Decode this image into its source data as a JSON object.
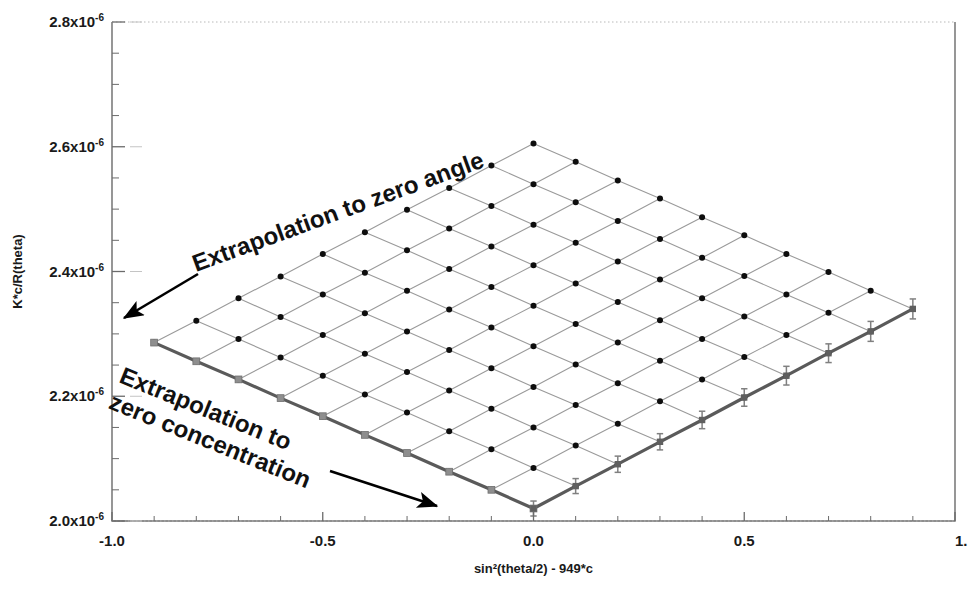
{
  "figure": {
    "name": "zimm-plot",
    "width": 973,
    "height": 591,
    "background": "#ffffff"
  },
  "axes": {
    "frame_color": "#6b6b6b",
    "left_px": 112,
    "right_px": 955,
    "top_px": 22,
    "bottom_px": 521,
    "x": {
      "label": "sin²(theta/2) - 949*c",
      "min": -1.0,
      "max": 1.0,
      "major_ticks": [
        -1.0,
        -0.5,
        0.0,
        0.5,
        1.0
      ],
      "major_tick_labels": [
        "-1.0",
        "-0.5",
        "0.0",
        "0.5",
        "1."
      ],
      "minor_step": 0.1
    },
    "y": {
      "label": "K*c/R(theta)",
      "min": 2e-06,
      "max": 2.8e-06,
      "major_ticks": [
        2e-06,
        2.2e-06,
        2.4e-06,
        2.6e-06,
        2.8e-06
      ],
      "major_tick_labels": [
        {
          "mantissa": "2.0x10",
          "exponent": "-6"
        },
        {
          "mantissa": "2.2x10",
          "exponent": "-6"
        },
        {
          "mantissa": "2.4x10",
          "exponent": "-6"
        },
        {
          "mantissa": "2.6x10",
          "exponent": "-6"
        },
        {
          "mantissa": "2.8x10",
          "exponent": "-6"
        }
      ],
      "minor_step": 5e-08
    }
  },
  "annotations": [
    {
      "name": "extrapolation-zero-angle-label",
      "lines": [
        "Extrapolation to zero angle"
      ],
      "x": 196,
      "y": 272,
      "rotation": -20
    },
    {
      "name": "extrapolation-zero-concentration-label",
      "lines": [
        "Extrapolation to",
        "zero concentration"
      ],
      "x": 118,
      "y": 382,
      "rotation": 22
    }
  ],
  "arrows": [
    {
      "name": "zero-angle-arrow",
      "x1": 198,
      "y1": 274,
      "x2": 124,
      "y2": 318,
      "color": "#000000"
    },
    {
      "name": "zero-concentration-arrow",
      "x1": 330,
      "y1": 471,
      "x2": 437,
      "y2": 506,
      "color": "#000000"
    }
  ],
  "style": {
    "mesh_line_color": "#9a9a9a",
    "mesh_line_width": 1.1,
    "envelope_color": "#5a5a5a",
    "envelope_width": 3.2,
    "marker_color": "#0d0d0d",
    "marker_radius": 3.0,
    "extrap_marker_color": "#8e8e8e",
    "errorbar_color": "#808080"
  },
  "chart_data": {
    "type": "line",
    "title": "",
    "xlabel": "sin²(theta/2) - 949*c",
    "ylabel": "K*c/R(theta)",
    "xlim": [
      -1.0,
      1.0
    ],
    "ylim": [
      2e-06,
      2.8e-06
    ],
    "grid": false,
    "legend": "none",
    "k_stretch": 949,
    "concentrations_count": 10,
    "angles_count": 10,
    "q2_values": [
      0.0,
      0.1,
      0.2,
      0.3,
      0.4,
      0.5,
      0.6,
      0.7,
      0.8,
      0.9
    ],
    "c_offsets": [
      0.0,
      0.1,
      0.2,
      0.3,
      0.4,
      0.5,
      0.6,
      0.7,
      0.8,
      0.9
    ],
    "intercept": 2.02e-06,
    "angle_slope": 3.55e-07,
    "conc_slope": 2.95e-07,
    "series": [
      {
        "name": "c1",
        "c_index": 0,
        "x": [
          0.0,
          0.1,
          0.2,
          0.3,
          0.4,
          0.5,
          0.6,
          0.7,
          0.8,
          0.9
        ],
        "values": [
          2.02e-06,
          2.056e-06,
          2.091e-06,
          2.127e-06,
          2.162e-06,
          2.198e-06,
          2.233e-06,
          2.269e-06,
          2.304e-06,
          2.34e-06
        ]
      },
      {
        "name": "c2",
        "c_index": 1,
        "x": [
          -0.1,
          0.0,
          0.1,
          0.2,
          0.3,
          0.4,
          0.5,
          0.6,
          0.7,
          0.8
        ],
        "values": [
          2.05e-06,
          2.085e-06,
          2.121e-06,
          2.156e-06,
          2.192e-06,
          2.227e-06,
          2.263e-06,
          2.298e-06,
          2.334e-06,
          2.369e-06
        ]
      },
      {
        "name": "c3",
        "c_index": 2,
        "x": [
          -0.2,
          -0.1,
          0.0,
          0.1,
          0.2,
          0.3,
          0.4,
          0.5,
          0.6,
          0.7
        ],
        "values": [
          2.079e-06,
          2.115e-06,
          2.15e-06,
          2.186e-06,
          2.221e-06,
          2.257e-06,
          2.292e-06,
          2.328e-06,
          2.363e-06,
          2.399e-06
        ]
      },
      {
        "name": "c4",
        "c_index": 3,
        "x": [
          -0.3,
          -0.2,
          -0.1,
          0.0,
          0.1,
          0.2,
          0.3,
          0.4,
          0.5,
          0.6
        ],
        "values": [
          2.109e-06,
          2.144e-06,
          2.18e-06,
          2.215e-06,
          2.251e-06,
          2.286e-06,
          2.322e-06,
          2.357e-06,
          2.393e-06,
          2.428e-06
        ]
      },
      {
        "name": "c5",
        "c_index": 4,
        "x": [
          -0.4,
          -0.3,
          -0.2,
          -0.1,
          0.0,
          0.1,
          0.2,
          0.3,
          0.4,
          0.5
        ],
        "values": [
          2.138e-06,
          2.174e-06,
          2.209e-06,
          2.245e-06,
          2.28e-06,
          2.316e-06,
          2.351e-06,
          2.387e-06,
          2.422e-06,
          2.458e-06
        ]
      },
      {
        "name": "c6",
        "c_index": 5,
        "x": [
          -0.5,
          -0.4,
          -0.3,
          -0.2,
          -0.1,
          0.0,
          0.1,
          0.2,
          0.3,
          0.4
        ],
        "values": [
          2.168e-06,
          2.203e-06,
          2.239e-06,
          2.274e-06,
          2.31e-06,
          2.345e-06,
          2.381e-06,
          2.416e-06,
          2.452e-06,
          2.487e-06
        ]
      },
      {
        "name": "c7",
        "c_index": 6,
        "x": [
          -0.6,
          -0.5,
          -0.4,
          -0.3,
          -0.2,
          -0.1,
          0.0,
          0.1,
          0.2,
          0.3
        ],
        "values": [
          2.197e-06,
          2.233e-06,
          2.268e-06,
          2.304e-06,
          2.339e-06,
          2.375e-06,
          2.41e-06,
          2.446e-06,
          2.481e-06,
          2.517e-06
        ]
      },
      {
        "name": "c8",
        "c_index": 7,
        "x": [
          -0.7,
          -0.6,
          -0.5,
          -0.4,
          -0.3,
          -0.2,
          -0.1,
          0.0,
          0.1,
          0.2
        ],
        "values": [
          2.227e-06,
          2.262e-06,
          2.298e-06,
          2.333e-06,
          2.369e-06,
          2.404e-06,
          2.44e-06,
          2.475e-06,
          2.511e-06,
          2.546e-06
        ]
      },
      {
        "name": "c9",
        "c_index": 8,
        "x": [
          -0.8,
          -0.7,
          -0.6,
          -0.5,
          -0.4,
          -0.3,
          -0.2,
          -0.1,
          0.0,
          0.1
        ],
        "values": [
          2.256e-06,
          2.292e-06,
          2.327e-06,
          2.363e-06,
          2.398e-06,
          2.434e-06,
          2.469e-06,
          2.505e-06,
          2.54e-06,
          2.576e-06
        ]
      },
      {
        "name": "c10",
        "c_index": 9,
        "x": [
          -0.9,
          -0.8,
          -0.7,
          -0.6,
          -0.5,
          -0.4,
          -0.3,
          -0.2,
          -0.1,
          0.0
        ],
        "values": [
          2.286e-06,
          2.321e-06,
          2.357e-06,
          2.392e-06,
          2.428e-06,
          2.463e-06,
          2.499e-06,
          2.534e-06,
          2.57e-06,
          2.605e-06
        ]
      }
    ],
    "zero_angle_line": {
      "name": "extrapolation-to-zero-angle",
      "x": [
        0.0,
        -0.1,
        -0.2,
        -0.3,
        -0.4,
        -0.5,
        -0.6,
        -0.7,
        -0.8,
        -0.9
      ],
      "values": [
        2.02e-06,
        2.05e-06,
        2.079e-06,
        2.109e-06,
        2.138e-06,
        2.168e-06,
        2.197e-06,
        2.227e-06,
        2.256e-06,
        2.286e-06
      ]
    },
    "zero_conc_line": {
      "name": "extrapolation-to-zero-concentration",
      "x": [
        0.0,
        0.1,
        0.2,
        0.3,
        0.4,
        0.5,
        0.6,
        0.7,
        0.8,
        0.9
      ],
      "values": [
        2.02e-06,
        2.056e-06,
        2.091e-06,
        2.127e-06,
        2.162e-06,
        2.198e-06,
        2.233e-06,
        2.269e-06,
        2.304e-06,
        2.34e-06
      ],
      "errors": [
        1.2e-08,
        1.2e-08,
        1.3e-08,
        1.3e-08,
        1.4e-08,
        1.4e-08,
        1.5e-08,
        1.5e-08,
        1.6e-08,
        1.6e-08
      ]
    }
  }
}
